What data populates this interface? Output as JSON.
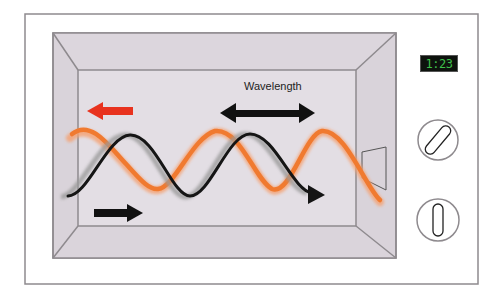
{
  "diagram": {
    "labels": {
      "wavelength": "Wavelength"
    },
    "display": {
      "time": "1:23",
      "text_color": "#3fbf4a",
      "bg_color": "#0d120d"
    },
    "colors": {
      "frame_line": "#8e8a8e",
      "cavity_side": "#d9d3da",
      "cavity_back": "#e3dee4",
      "incident_wave": "#1a1a1a",
      "reflected_wave": "#f07a30",
      "reflected_arrow": "#e8321e",
      "incident_arrow": "#111111"
    },
    "elements": [
      {
        "name": "outer-casing"
      },
      {
        "name": "cooking-cavity"
      },
      {
        "name": "incident-wave",
        "direction": "right"
      },
      {
        "name": "reflected-wave",
        "direction": "left"
      },
      {
        "name": "wavelength-indicator"
      },
      {
        "name": "waveguide-port"
      },
      {
        "name": "timer-display"
      },
      {
        "name": "control-knob-1"
      },
      {
        "name": "control-knob-2"
      }
    ]
  }
}
